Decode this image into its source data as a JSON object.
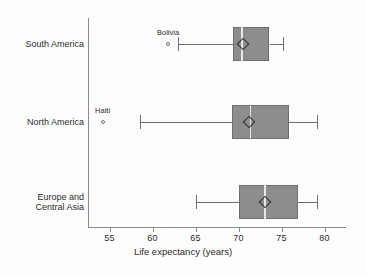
{
  "chart_data": {
    "type": "box",
    "title": "",
    "xlabel": "Life expectancy (years)",
    "ylabel": "",
    "xlim": [
      52.5,
      82.5
    ],
    "grid": false,
    "legend": "none",
    "orientation": "horizontal",
    "xticks": [
      55,
      60,
      65,
      70,
      75,
      80
    ],
    "xtick_labels": [
      "55",
      "60",
      "65",
      "70",
      "75",
      "80"
    ],
    "categories": [
      "South America",
      "North America",
      "Europe and Central Asia"
    ],
    "boxes": [
      {
        "category": "South America",
        "label_line1": "South America",
        "label_line2": "",
        "whisker_low": 63.0,
        "q1": 69.4,
        "median": 70.3,
        "q3": 73.6,
        "whisker_high": 75.2,
        "mean": 70.5,
        "outliers": [
          {
            "name": "Bolivia",
            "value": 61.8
          }
        ]
      },
      {
        "category": "North America",
        "label_line1": "North America",
        "label_line2": "",
        "whisker_low": 58.5,
        "q1": 69.2,
        "median": 71.3,
        "q3": 75.9,
        "whisker_high": 79.1,
        "mean": 71.2,
        "outliers": [
          {
            "name": "Haiti",
            "value": 54.2
          }
        ]
      },
      {
        "category": "Europe and Central Asia",
        "label_line1": "Europe and",
        "label_line2": "Central Asia",
        "whisker_low": 65.0,
        "q1": 70.0,
        "median": 73.0,
        "q3": 76.9,
        "whisker_high": 79.1,
        "mean": 73.1,
        "outliers": []
      }
    ],
    "colors": {
      "box_fill": "#8d8d8d",
      "box_edge": "#6f6f6f",
      "median_line": "#e8e8e8",
      "whisker": "#6f6f6f",
      "mean_marker": "#2b2b2b",
      "outlier_marker": "#6b6b6b",
      "axis": "#8a8a8a",
      "text": "#2b2b2b",
      "background": "#fdfdfd"
    }
  }
}
